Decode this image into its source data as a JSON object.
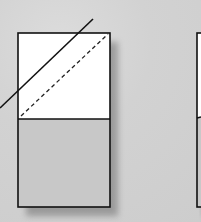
{
  "diagram": {
    "colors": {
      "background": "#d2d2d2",
      "top_fill": "#ffffff",
      "bottom_fill": "#c8c8c8",
      "stroke": "#111111",
      "shadow": "#6e6e6e"
    },
    "left_box": {
      "x": 18,
      "y": 33,
      "width": 92,
      "height": 174,
      "divider_y": 119
    },
    "solid_line": {
      "x1": 0,
      "y1": 108,
      "x2": 93,
      "y2": 19
    },
    "dashed_line": {
      "x1": 21,
      "y1": 116,
      "x2": 108,
      "y2": 34
    },
    "right_box": {
      "x": 197,
      "y": 33,
      "width": 10,
      "height": 174,
      "divider_y": 118
    }
  }
}
